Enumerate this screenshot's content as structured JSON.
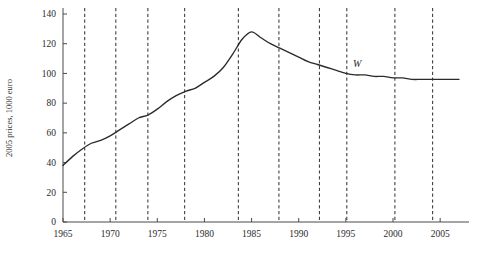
{
  "chart_data": {
    "type": "line",
    "title": "",
    "subtitle": "",
    "xlabel": "",
    "ylabel": "2005 prices, 1000 euro",
    "xlim": [
      1965,
      2007
    ],
    "ylim": [
      0,
      140
    ],
    "grid": false,
    "legend_position": "inline-right",
    "x_ticks": [
      1965,
      1970,
      1975,
      1980,
      1985,
      1990,
      1995,
      2000,
      2005
    ],
    "x_tick_labels": [
      "1965",
      "1970",
      "1975",
      "1980",
      "1985",
      "1990",
      "1995",
      "2000",
      "2005"
    ],
    "y_ticks": [
      0,
      20,
      40,
      60,
      80,
      100,
      120,
      140
    ],
    "y_tick_labels": [
      "0",
      "20",
      "40",
      "60",
      "80",
      "100",
      "120",
      "140"
    ],
    "series": [
      {
        "name": "W",
        "label": "W",
        "color": "#2b2b2b",
        "style": "solid",
        "x": [
          1965,
          1966,
          1967,
          1968,
          1969,
          1970,
          1971,
          1972,
          1973,
          1974,
          1975,
          1976,
          1977,
          1978,
          1979,
          1980,
          1981,
          1982,
          1983,
          1984,
          1985,
          1986,
          1987,
          1988,
          1989,
          1990,
          1991,
          1992,
          1993,
          1994,
          1995,
          1996,
          1997,
          1998,
          1999,
          2000,
          2001,
          2002,
          2003,
          2004,
          2005,
          2006,
          2007
        ],
        "values": [
          38,
          44,
          49,
          53,
          55,
          58,
          62,
          66,
          70,
          72,
          76,
          81,
          85,
          88,
          90,
          94,
          98,
          104,
          113,
          123,
          128,
          124,
          120,
          117,
          114,
          111,
          108,
          106,
          104,
          102,
          100,
          99,
          99,
          98,
          98,
          97,
          97,
          96,
          96,
          96,
          96,
          96,
          96
        ]
      }
    ],
    "event_lines": {
      "style": "dashed",
      "color": "#404040",
      "years": [
        1967.3,
        1970.6,
        1974.0,
        1977.9,
        1983.6,
        1987.9,
        1992.2,
        1995.1,
        2000.2,
        2004.2
      ]
    }
  },
  "series_label": {
    "text": "W",
    "x_year": 1996.2,
    "y_value": 104
  }
}
